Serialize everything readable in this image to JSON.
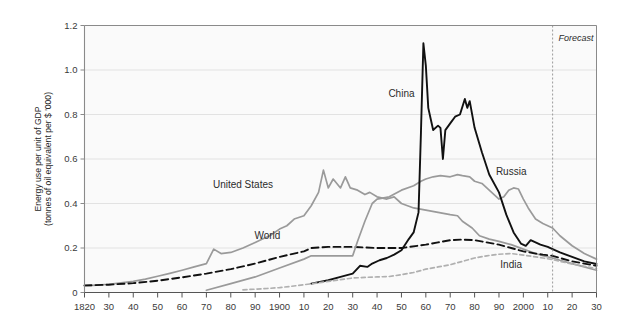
{
  "chart_data": {
    "type": "line",
    "title": "",
    "subtitle": "",
    "xlabel": "",
    "ylabel": "Energy use per unit of GDP\n(tonnes of oil equivalent per $ '000)",
    "ylabel_line1": "Energy use per unit of GDP",
    "ylabel_line2": "(tonnes of oil equivalent per $ '000)",
    "xlim": [
      1820,
      2030
    ],
    "ylim": [
      0,
      1.2
    ],
    "grid": true,
    "legend_position": "inline-annotations",
    "y_ticks": [
      0,
      0.2,
      0.4,
      0.6,
      0.8,
      1.0,
      1.2
    ],
    "y_tick_labels": [
      "0",
      "0.2",
      "0.4",
      "0.6",
      "0.8",
      "1.0",
      "1.2"
    ],
    "x_ticks": [
      1820,
      1830,
      1840,
      1850,
      1860,
      1870,
      1880,
      1890,
      1900,
      1910,
      1920,
      1930,
      1940,
      1950,
      1960,
      1970,
      1980,
      1990,
      2000,
      2010,
      2020,
      2030
    ],
    "x_tick_labels": [
      "1820",
      "30",
      "40",
      "50",
      "60",
      "70",
      "80",
      "90",
      "1900",
      "10",
      "20",
      "30",
      "40",
      "50",
      "60",
      "70",
      "80",
      "90",
      "2000",
      "10",
      "20",
      "30"
    ],
    "annotations": [
      {
        "text": "Forecast",
        "x": 2012,
        "y": 1.13,
        "style": "italic"
      }
    ],
    "forecast_divider_x": 2012,
    "series": [
      {
        "name": "United States",
        "color": "#9a9a9a",
        "style": "solid",
        "label_x": 1885,
        "label_y": 0.47,
        "x": [
          1820,
          1825,
          1830,
          1835,
          1840,
          1845,
          1850,
          1855,
          1860,
          1865,
          1870,
          1873,
          1876,
          1880,
          1885,
          1890,
          1893,
          1896,
          1900,
          1903,
          1906,
          1910,
          1913,
          1916,
          1918,
          1920,
          1922,
          1925,
          1927,
          1929,
          1932,
          1935,
          1937,
          1940,
          1944,
          1947,
          1950,
          1955,
          1960,
          1965,
          1970,
          1973,
          1975,
          1979,
          1982,
          1986,
          1990,
          1995,
          2000,
          2005,
          2008,
          2012,
          2015,
          2020,
          2025,
          2030
        ],
        "y": [
          0.03,
          0.033,
          0.037,
          0.043,
          0.05,
          0.06,
          0.073,
          0.086,
          0.1,
          0.115,
          0.13,
          0.195,
          0.175,
          0.18,
          0.2,
          0.225,
          0.24,
          0.255,
          0.285,
          0.3,
          0.33,
          0.345,
          0.39,
          0.45,
          0.55,
          0.47,
          0.51,
          0.47,
          0.52,
          0.47,
          0.46,
          0.44,
          0.45,
          0.43,
          0.42,
          0.43,
          0.4,
          0.38,
          0.37,
          0.36,
          0.35,
          0.345,
          0.32,
          0.29,
          0.255,
          0.24,
          0.23,
          0.215,
          0.195,
          0.175,
          0.165,
          0.155,
          0.145,
          0.13,
          0.115,
          0.1
        ]
      },
      {
        "name": "World",
        "color": "#111111",
        "style": "dashed",
        "label_x": 1895,
        "label_y": 0.24,
        "x": [
          1820,
          1830,
          1840,
          1850,
          1860,
          1870,
          1880,
          1890,
          1900,
          1910,
          1913,
          1920,
          1930,
          1940,
          1950,
          1960,
          1965,
          1970,
          1975,
          1980,
          1985,
          1990,
          1995,
          2000,
          2005,
          2008,
          2012,
          2015,
          2020,
          2025,
          2030
        ],
        "y": [
          0.032,
          0.035,
          0.042,
          0.053,
          0.068,
          0.085,
          0.105,
          0.13,
          0.16,
          0.185,
          0.2,
          0.205,
          0.205,
          0.2,
          0.2,
          0.215,
          0.225,
          0.235,
          0.238,
          0.235,
          0.225,
          0.215,
          0.2,
          0.185,
          0.175,
          0.17,
          0.165,
          0.155,
          0.14,
          0.13,
          0.12
        ]
      },
      {
        "name": "Russia",
        "color": "#9a9a9a",
        "style": "solid",
        "label_x": 1995,
        "label_y": 0.53,
        "x": [
          1870,
          1880,
          1890,
          1900,
          1910,
          1913,
          1920,
          1925,
          1930,
          1932,
          1935,
          1938,
          1940,
          1945,
          1950,
          1955,
          1958,
          1960,
          1963,
          1966,
          1970,
          1973,
          1975,
          1978,
          1980,
          1983,
          1986,
          1990,
          1992,
          1994,
          1996,
          1998,
          2000,
          2002,
          2005,
          2008,
          2010,
          2012,
          2015,
          2020,
          2025,
          2030
        ],
        "y": [
          0.01,
          0.04,
          0.07,
          0.11,
          0.15,
          0.165,
          0.165,
          0.165,
          0.165,
          0.23,
          0.32,
          0.4,
          0.42,
          0.43,
          0.46,
          0.48,
          0.5,
          0.51,
          0.52,
          0.525,
          0.52,
          0.53,
          0.525,
          0.52,
          0.5,
          0.49,
          0.46,
          0.42,
          0.43,
          0.46,
          0.47,
          0.465,
          0.42,
          0.38,
          0.33,
          0.31,
          0.3,
          0.29,
          0.255,
          0.21,
          0.175,
          0.15
        ]
      },
      {
        "name": "China",
        "color": "#111111",
        "style": "solid",
        "label_x": 1950,
        "label_y": 0.88,
        "x": [
          1913,
          1920,
          1925,
          1930,
          1933,
          1936,
          1938,
          1941,
          1944,
          1947,
          1950,
          1953,
          1955,
          1957,
          1958,
          1959,
          1960,
          1961,
          1962,
          1963,
          1965,
          1966,
          1967,
          1968,
          1970,
          1972,
          1974,
          1976,
          1977,
          1978,
          1980,
          1983,
          1986,
          1990,
          1993,
          1996,
          1999,
          2001,
          2003,
          2005,
          2007,
          2010,
          2012,
          2015,
          2020,
          2025,
          2030
        ],
        "y": [
          0.04,
          0.055,
          0.07,
          0.085,
          0.12,
          0.115,
          0.13,
          0.145,
          0.155,
          0.17,
          0.19,
          0.24,
          0.27,
          0.36,
          0.72,
          1.12,
          1.02,
          0.83,
          0.78,
          0.73,
          0.75,
          0.74,
          0.6,
          0.73,
          0.76,
          0.79,
          0.8,
          0.87,
          0.83,
          0.86,
          0.74,
          0.63,
          0.53,
          0.45,
          0.35,
          0.27,
          0.22,
          0.21,
          0.235,
          0.225,
          0.215,
          0.205,
          0.195,
          0.18,
          0.16,
          0.14,
          0.128
        ]
      },
      {
        "name": "India",
        "color": "#b0b0b0",
        "style": "dashed",
        "label_x": 1995,
        "label_y": 0.11,
        "x": [
          1885,
          1890,
          1895,
          1900,
          1905,
          1910,
          1915,
          1920,
          1925,
          1930,
          1935,
          1940,
          1945,
          1950,
          1955,
          1960,
          1965,
          1970,
          1975,
          1980,
          1985,
          1990,
          1995,
          2000,
          2005,
          2008,
          2012,
          2015,
          2020,
          2025,
          2030
        ],
        "y": [
          0.012,
          0.015,
          0.018,
          0.022,
          0.028,
          0.035,
          0.042,
          0.05,
          0.058,
          0.065,
          0.068,
          0.07,
          0.072,
          0.08,
          0.09,
          0.105,
          0.115,
          0.125,
          0.14,
          0.155,
          0.165,
          0.172,
          0.175,
          0.168,
          0.16,
          0.155,
          0.148,
          0.14,
          0.128,
          0.118,
          0.108
        ]
      }
    ]
  },
  "colors": {
    "plot_background": "#fafafa",
    "grid": "#e2e2e2",
    "axis": "#8a8a8a",
    "black_series": "#111111",
    "gray_series": "#9a9a9a",
    "light_gray_series": "#b0b0b0",
    "text": "#2b2b2b"
  }
}
